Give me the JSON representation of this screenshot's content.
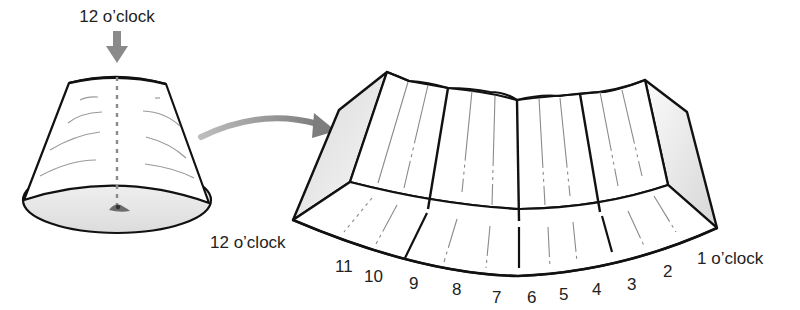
{
  "labels": {
    "top_marker": "12 o’clock",
    "left_edge": "12 o’clock",
    "right_edge": "1 o’clock"
  },
  "clock_positions": [
    "11",
    "10",
    "9",
    "8",
    "7",
    "6",
    "5",
    "4",
    "3",
    "2"
  ],
  "icons": {
    "down_arrow": "down-arrow-icon",
    "curved_arrow": "curved-arrow-icon",
    "eye": "eye-icon"
  },
  "colors": {
    "outline": "#111111",
    "arrow": "#8a8a8a",
    "shade": "#e6e6e6",
    "fold_line": "#9a9a9a",
    "text": "#222222"
  }
}
